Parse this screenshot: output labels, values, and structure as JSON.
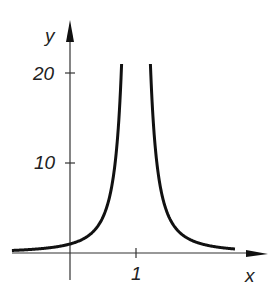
{
  "chart_data": {
    "type": "line",
    "title": "",
    "xlabel": "x",
    "ylabel": "y",
    "function": "y = 1/(x-1)^2",
    "x_ticks": [
      {
        "value": 1,
        "label": "1"
      }
    ],
    "y_ticks": [
      {
        "value": 10,
        "label": "10"
      },
      {
        "value": 20,
        "label": "20"
      }
    ],
    "xlim": [
      -0.85,
      3.2
    ],
    "ylim": [
      0,
      23
    ],
    "grid": false,
    "series": [
      {
        "name": "f(x)",
        "x": [
          -0.8,
          -0.5,
          0,
          0.3,
          0.5,
          0.7,
          0.78,
          1.22,
          1.3,
          1.5,
          1.7,
          2,
          2.5,
          2.5
        ],
        "values": [
          0.31,
          0.44,
          1,
          2.04,
          4,
          11.1,
          20.7,
          20.7,
          11.1,
          4,
          2.04,
          1,
          0.44,
          0.44
        ]
      }
    ],
    "asymptote_x": 1
  },
  "labels": {
    "y_axis": "y",
    "x_axis": "x",
    "tick_20": "20",
    "tick_10": "10",
    "tick_1": "1"
  }
}
